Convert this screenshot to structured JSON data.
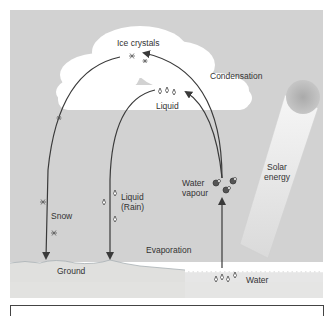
{
  "diagram": {
    "colors": {
      "sky": "#d2d2d2",
      "cloud": "#ffffff",
      "ground": "#e2e2e0",
      "water": "#ececec",
      "arrow": "#3a3a3a",
      "sun": "#b8b8b8",
      "beam": "#f2f2f2"
    },
    "labels": {
      "ice_crystals": "Ice crystals",
      "condensation": "Condensation",
      "liquid_cloud": "Liquid",
      "snow": "Snow",
      "liquid_rain_line1": "Liquid",
      "liquid_rain_line2": "(Rain)",
      "water_vapour_line1": "Water",
      "water_vapour_line2": "vapour",
      "solar_energy_line1": "Solar",
      "solar_energy_line2": "energy",
      "evaporation": "Evaporation",
      "ground": "Ground",
      "water": "Water"
    },
    "icons": [
      "snowflake-icon",
      "raindrop-icon",
      "water-molecule-icon",
      "sun-icon"
    ]
  },
  "caption": {
    "text": ""
  }
}
